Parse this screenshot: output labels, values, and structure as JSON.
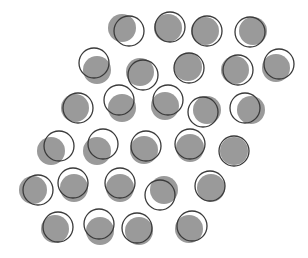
{
  "figure": {
    "width": 308,
    "height": 258,
    "background": "#ffffff",
    "disc_color": "#9a9a9a",
    "ring_color": "#3a3a3a",
    "disc_radius": 14,
    "ring_radius": 15,
    "ring_stroke_width": 1.3
  },
  "items": [
    {
      "disc": [
        122,
        28
      ],
      "ring": [
        129,
        31
      ]
    },
    {
      "disc": [
        168,
        28
      ],
      "ring": [
        170,
        27
      ]
    },
    {
      "disc": [
        205,
        31
      ],
      "ring": [
        207,
        31
      ]
    },
    {
      "disc": [
        253,
        31
      ],
      "ring": [
        250,
        32
      ]
    },
    {
      "disc": [
        97,
        70
      ],
      "ring": [
        94,
        63
      ]
    },
    {
      "disc": [
        140,
        72
      ],
      "ring": [
        143,
        75
      ]
    },
    {
      "disc": [
        188,
        67
      ],
      "ring": [
        189,
        68
      ]
    },
    {
      "disc": [
        235,
        70
      ],
      "ring": [
        238,
        70
      ]
    },
    {
      "disc": [
        276,
        68
      ],
      "ring": [
        279,
        64
      ]
    },
    {
      "disc": [
        75,
        108
      ],
      "ring": [
        78,
        108
      ]
    },
    {
      "disc": [
        122,
        108
      ],
      "ring": [
        119,
        100
      ]
    },
    {
      "disc": [
        165,
        106
      ],
      "ring": [
        168,
        100
      ]
    },
    {
      "disc": [
        207,
        110
      ],
      "ring": [
        203,
        112
      ]
    },
    {
      "disc": [
        251,
        110
      ],
      "ring": [
        245,
        108
      ]
    },
    {
      "disc": [
        51,
        151
      ],
      "ring": [
        59,
        146
      ]
    },
    {
      "disc": [
        97,
        151
      ],
      "ring": [
        103,
        144
      ]
    },
    {
      "disc": [
        144,
        150
      ],
      "ring": [
        146,
        146
      ]
    },
    {
      "disc": [
        190,
        148
      ],
      "ring": [
        190,
        144
      ]
    },
    {
      "disc": [
        234,
        151
      ],
      "ring": [
        234,
        151
      ]
    },
    {
      "disc": [
        33,
        190
      ],
      "ring": [
        38,
        190
      ]
    },
    {
      "disc": [
        74,
        188
      ],
      "ring": [
        73,
        183
      ]
    },
    {
      "disc": [
        120,
        188
      ],
      "ring": [
        120,
        183
      ]
    },
    {
      "disc": [
        164,
        190
      ],
      "ring": [
        160,
        195
      ]
    },
    {
      "disc": [
        211,
        188
      ],
      "ring": [
        210,
        186
      ]
    },
    {
      "disc": [
        55,
        229
      ],
      "ring": [
        58,
        227
      ]
    },
    {
      "disc": [
        100,
        231
      ],
      "ring": [
        99,
        224
      ]
    },
    {
      "disc": [
        139,
        231
      ],
      "ring": [
        137,
        228
      ]
    },
    {
      "disc": [
        189,
        229
      ],
      "ring": [
        192,
        226
      ]
    }
  ]
}
